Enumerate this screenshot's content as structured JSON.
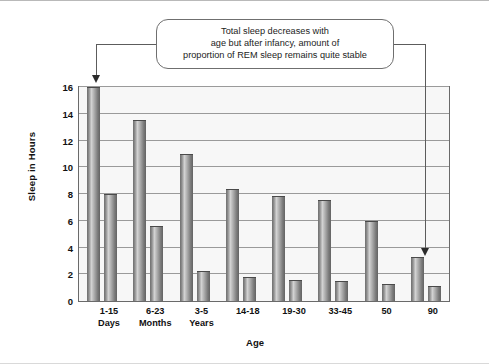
{
  "callout": {
    "name": "annotation-callout",
    "lines": [
      "Total sleep decreases with",
      "age but after infancy, amount of",
      "proportion of REM sleep remains quite stable"
    ]
  },
  "axes": {
    "y_title": "Sleep in Hours",
    "x_title": "Age"
  },
  "chart_data": {
    "type": "bar",
    "title": "",
    "xlabel": "Age",
    "ylabel": "Sleep in Hours",
    "ylim": [
      0,
      16
    ],
    "yticks": [
      0,
      2,
      4,
      6,
      8,
      10,
      12,
      14,
      16
    ],
    "ytick_labels": [
      "0",
      "2",
      "4",
      "6",
      "8",
      "10",
      "12",
      "14",
      "16"
    ],
    "grid": true,
    "legend": "none",
    "categories": [
      "1-15 Days",
      "6-23 Months",
      "3-5 Years",
      "14-18",
      "19-30",
      "33-45",
      "50",
      "90"
    ],
    "category_lines": [
      [
        "1-15",
        "Days"
      ],
      [
        "6-23",
        "Months"
      ],
      [
        "3-5",
        "Years"
      ],
      [
        "14-18",
        ""
      ],
      [
        "19-30",
        ""
      ],
      [
        "33-45",
        ""
      ],
      [
        "50",
        ""
      ],
      [
        "90",
        ""
      ]
    ],
    "series": [
      {
        "name": "Total sleep",
        "values": [
          16.0,
          13.5,
          11.0,
          8.4,
          7.85,
          7.55,
          6.0,
          3.3
        ]
      },
      {
        "name": "REM sleep",
        "values": [
          8.0,
          5.6,
          2.25,
          1.8,
          1.55,
          1.5,
          1.25,
          1.1
        ]
      }
    ],
    "annotations": [
      {
        "text": "Total sleep decreases with age but after infancy, amount of proportion of REM sleep remains quite stable",
        "points_to": [
          "1-15 Days total bar",
          "90 total bar"
        ]
      }
    ],
    "colors": {
      "bar_dark": "#6e6e6e",
      "bar_light": "#d3d3d3",
      "plot_background": "#f7f7f7",
      "gridline": "#9a9a9a",
      "axis_border": "#6a6a6a",
      "connector": "#5c5c5c",
      "text": "#111111"
    }
  }
}
